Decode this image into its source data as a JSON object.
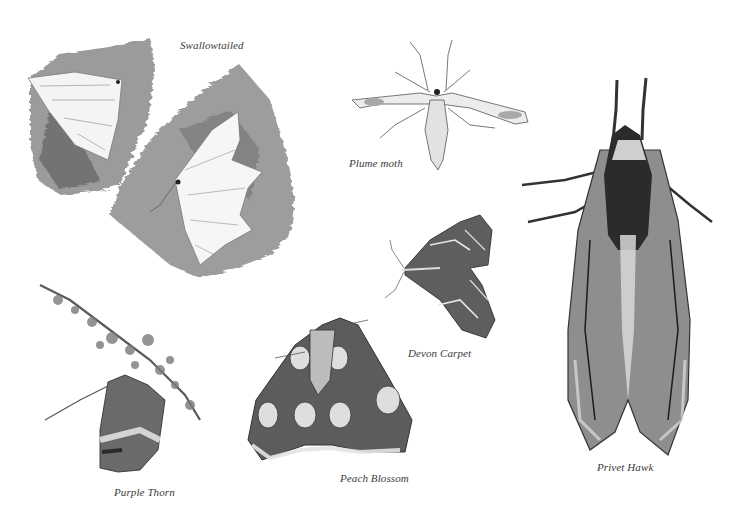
{
  "plate": {
    "background": "#ffffff",
    "ink_color": "#2a2a2a",
    "specimens": [
      {
        "id": "swallowtailed",
        "label": "Swallowtailed",
        "count": 2
      },
      {
        "id": "plume-moth",
        "label": "Plume moth",
        "count": 1
      },
      {
        "id": "privet-hawk",
        "label": "Privet Hawk",
        "count": 1
      },
      {
        "id": "devon-carpet",
        "label": "Devon Carpet",
        "count": 1
      },
      {
        "id": "purple-thorn",
        "label": "Purple Thorn",
        "count": 1
      },
      {
        "id": "peach-blossom",
        "label": "Peach Blossom",
        "count": 1
      }
    ]
  }
}
